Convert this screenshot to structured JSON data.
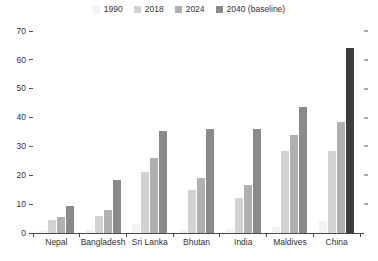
{
  "chart_data": {
    "type": "bar",
    "title": "",
    "subtitle": "",
    "xlabel": "",
    "ylabel": "",
    "ylim": [
      0,
      70
    ],
    "yticks": [
      0,
      10,
      20,
      30,
      40,
      50,
      60,
      70
    ],
    "grid": false,
    "legend_position": "top-center",
    "categories": [
      "Nepal",
      "Bangladesh",
      "Sri Lanka",
      "Bhutan",
      "India",
      "Maldives",
      "China"
    ],
    "series": [
      {
        "name": "1990",
        "color": "#f2f2f2",
        "values": [
          1.0,
          1.0,
          3.0,
          1.0,
          1.5,
          2.0,
          4.0
        ]
      },
      {
        "name": "2018",
        "color": "#d2d2d2",
        "values": [
          4.5,
          6.0,
          21.0,
          15.0,
          12.0,
          28.5,
          28.5
        ]
      },
      {
        "name": "2024",
        "color": "#b0b0b0",
        "values": [
          5.5,
          8.0,
          26.0,
          19.0,
          16.5,
          34.0,
          38.5
        ]
      },
      {
        "name": "2040 (baseline)",
        "color": "#8a8a8a",
        "values": [
          9.5,
          18.5,
          35.5,
          36.0,
          36.0,
          43.5,
          64.0
        ]
      }
    ],
    "bar_color_overrides": [
      {
        "category": "China",
        "series": "2040 (baseline)",
        "color": "#3c3c3c"
      }
    ]
  },
  "legend": {
    "items": [
      {
        "label": "1990",
        "color": "#f2f2f2"
      },
      {
        "label": "2018",
        "color": "#d2d2d2"
      },
      {
        "label": "2024",
        "color": "#b0b0b0"
      },
      {
        "label": "2040 (baseline)",
        "color": "#8a8a8a"
      }
    ]
  },
  "axis": {
    "y_tick_labels": [
      "70",
      "60",
      "50",
      "40",
      "30",
      "20",
      "10",
      "0"
    ]
  }
}
